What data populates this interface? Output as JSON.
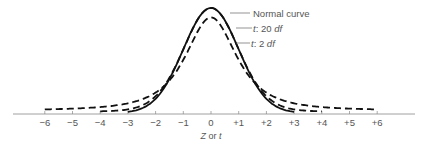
{
  "chart_data": {
    "type": "line",
    "title": "",
    "xlabel": "Z or t",
    "ylabel": "",
    "xlim": [
      -6,
      6
    ],
    "ticks": [
      "−6",
      "−5",
      "−4",
      "−3",
      "−2",
      "−1",
      "0",
      "+1",
      "+2",
      "+3",
      "+4",
      "+5",
      "+6"
    ],
    "tick_values": [
      -6,
      -5,
      -4,
      -3,
      -2,
      -1,
      0,
      1,
      2,
      3,
      4,
      5,
      6
    ],
    "grid": false,
    "legend_position": "annotations top-right of peak",
    "series": [
      {
        "name": "Normal curve",
        "style": "solid",
        "df": null
      },
      {
        "name": "t: 20 df",
        "style": "dashed",
        "df": 20
      },
      {
        "name": "t: 2 df",
        "style": "dashed",
        "df": 2
      }
    ],
    "annotations": [
      {
        "text": "Normal curve"
      },
      {
        "prefix": "t",
        "rest": ": 20 ",
        "suffix": "df"
      },
      {
        "prefix": "t",
        "rest": ": 2 ",
        "suffix": "df"
      }
    ]
  },
  "labels": {
    "xlabel_main": "Z",
    "xlabel_or": " or ",
    "xlabel_t": "t",
    "normal": "Normal curve",
    "t20_t": "t",
    "t20_mid": ": 20 ",
    "t20_df": "df",
    "t2_t": "t",
    "t2_mid": ": 2 ",
    "t2_df": "df"
  }
}
